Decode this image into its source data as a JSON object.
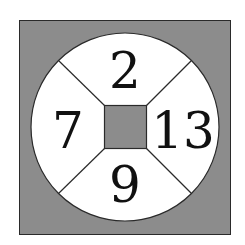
{
  "diagram": {
    "type": "number-wheel-puzzle",
    "colors": {
      "background": "#ffffff",
      "shaded_fill": "#8c8c8c",
      "circle_fill": "#ffffff",
      "stroke": "#2a2a2a",
      "text": "#111111"
    },
    "segments": {
      "top": {
        "value": "2"
      },
      "right": {
        "value": "13"
      },
      "bottom": {
        "value": "9"
      },
      "left": {
        "value": "7"
      }
    },
    "center": {
      "value": ""
    }
  }
}
